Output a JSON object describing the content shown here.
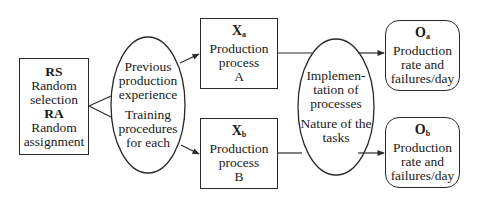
{
  "diagram": {
    "type": "research-design-flow",
    "colors": {
      "stroke": "#2a2a2a",
      "text": "#1a1a1a",
      "background": "#ffffff"
    },
    "sampling_box": {
      "rs_label": "RS",
      "rs_text": "Random selection",
      "ra_label": "RA",
      "ra_text": "Random assignment",
      "rs_line1": "Random",
      "rs_line2": "selection",
      "ra_line1": "Random",
      "ra_line2": "assignment"
    },
    "controls_ellipse_1": {
      "line1": "Previous",
      "line2": "production",
      "line3": "experience",
      "line4": "Training",
      "line5": "procedures",
      "line6": "for each"
    },
    "treatment_a": {
      "symbol": "X",
      "subscript": "a",
      "line1": "Production",
      "line2": "process",
      "line3": "A"
    },
    "treatment_b": {
      "symbol": "X",
      "subscript": "b",
      "line1": "Production",
      "line2": "process",
      "line3": "B"
    },
    "controls_ellipse_2": {
      "line1": "Implemen-",
      "line2": "tation of",
      "line3": "processes",
      "line4": "Nature of the",
      "line5": "tasks"
    },
    "outcome_a": {
      "symbol": "O",
      "subscript": "a",
      "line1": "Production",
      "line2": "rate and",
      "line3": "failures/day"
    },
    "outcome_b": {
      "symbol": "O",
      "subscript": "b",
      "line1": "Production",
      "line2": "rate and",
      "line3": "failures/day"
    },
    "edges": [
      {
        "from": "sampling_box",
        "to": "controls_ellipse_1",
        "style": "fork-lines"
      },
      {
        "from": "controls_ellipse_1",
        "to": "treatment_a",
        "style": "arrow"
      },
      {
        "from": "controls_ellipse_1",
        "to": "treatment_b",
        "style": "arrow"
      },
      {
        "from": "treatment_a",
        "to": "outcome_a",
        "style": "line-through-ellipse-arrow"
      },
      {
        "from": "treatment_b",
        "to": "outcome_b",
        "style": "line-through-ellipse-arrow"
      }
    ]
  }
}
